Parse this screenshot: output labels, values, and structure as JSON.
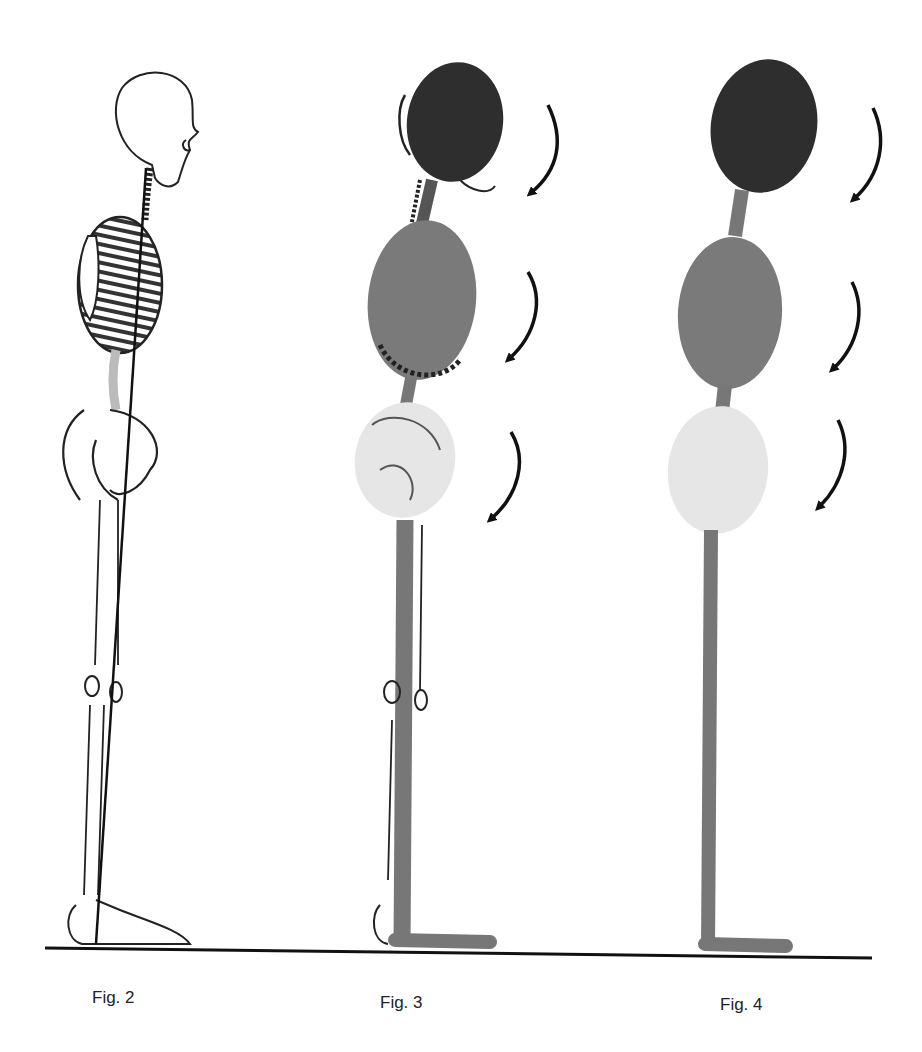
{
  "figures": [
    {
      "id": "fig2",
      "caption": "Fig. 2",
      "description": "Skeleton side view with vertical plumb line"
    },
    {
      "id": "fig3",
      "caption": "Fig. 3",
      "description": "Skeleton overlaid with head, thorax and pelvis ovals and leg bar"
    },
    {
      "id": "fig4",
      "caption": "Fig. 4",
      "description": "Simplified model: three stacked ovals on an L-shaped bar"
    }
  ],
  "segments": [
    {
      "name": "head",
      "color": "#2e2e2e"
    },
    {
      "name": "thorax",
      "color": "#7a7a7a"
    },
    {
      "name": "pelvis",
      "color": "#e6e6e6"
    }
  ],
  "colors": {
    "bar": "#777777",
    "ground": "#111111",
    "arrow": "#111111",
    "line": "#222222"
  },
  "arrows_per_figure": 3
}
